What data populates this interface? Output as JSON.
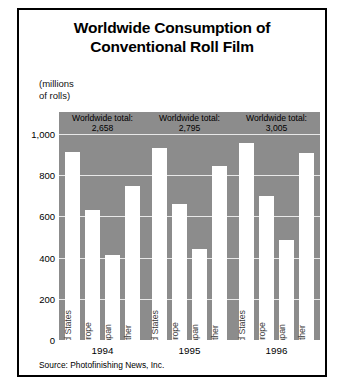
{
  "figure": {
    "title_lines": [
      "Worldwide Consumption of",
      "Conventional Roll Film"
    ],
    "units_lines": [
      "(millions",
      "of rolls)"
    ],
    "source": "Source: Photofinishing News, Inc.",
    "plot_background": "#8c8c8c",
    "bar_color": "#ffffff",
    "gridline_color": "#e8e8e8",
    "border_color": "#000000"
  },
  "chart_data": {
    "type": "bar",
    "title": "Worldwide Consumption of Conventional Roll Film",
    "xlabel": "",
    "ylabel": "(millions of rolls)",
    "ylim": [
      0,
      1000
    ],
    "yticks": [
      0,
      200,
      400,
      600,
      800,
      1000
    ],
    "ytick_labels": [
      "0",
      "200",
      "400",
      "600",
      "800",
      "1,000"
    ],
    "grid": true,
    "legend": "none",
    "categories": [
      "United States",
      "Europe",
      "Japan",
      "Other"
    ],
    "groups": [
      "1994",
      "1995",
      "1996"
    ],
    "series": [
      {
        "name": "1994",
        "values": [
          915,
          630,
          415,
          750
        ],
        "total_label": "Worldwide total:",
        "total_value": "2,658"
      },
      {
        "name": "1995",
        "values": [
          930,
          660,
          440,
          845
        ],
        "total_label": "Worldwide total:",
        "total_value": "2,795"
      },
      {
        "name": "1996",
        "values": [
          955,
          700,
          485,
          910
        ],
        "total_label": "Worldwide total:",
        "total_value": "3,005"
      }
    ]
  }
}
